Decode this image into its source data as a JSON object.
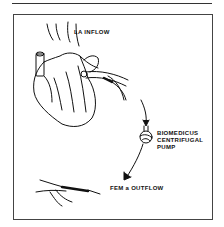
{
  "figure": {
    "labels": {
      "la_inflow": "LA INFLOW",
      "pump_line1": "BIOMEDICUS",
      "pump_line2": "CENTRIFUGAL",
      "pump_line3": "PUMP",
      "fem_outflow": "FEM a OUTFLOW"
    },
    "colors": {
      "ink": "#111111",
      "background": "#ffffff",
      "frame": "#444444"
    }
  }
}
